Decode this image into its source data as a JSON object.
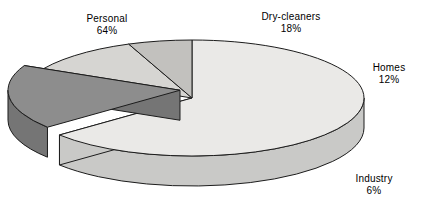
{
  "chart_data": {
    "type": "pie",
    "title": "",
    "subtitle": "",
    "xlabel": "",
    "ylabel": "",
    "legend_position": "none",
    "grid": false,
    "units": "percent",
    "style": "3d-exploded-pie",
    "total": 100,
    "categories": [
      "Personal",
      "Dry-cleaners",
      "Homes",
      "Industry"
    ],
    "values": [
      64,
      18,
      12,
      6
    ],
    "slices": [
      {
        "label": "Personal",
        "value": 64,
        "value_text": "64%",
        "top_color": "#eae9e7",
        "side_color": "#c9c9c7",
        "exploded": false
      },
      {
        "label": "Dry-cleaners",
        "value": 18,
        "value_text": "18%",
        "top_color": "#8d8d8d",
        "side_color": "#757575",
        "exploded": true
      },
      {
        "label": "Homes",
        "value": 12,
        "value_text": "12%",
        "top_color": "#d6d5d2",
        "side_color": "#bcbcba",
        "exploded": false
      },
      {
        "label": "Industry",
        "value": 6,
        "value_text": "6%",
        "top_color": "#c2c1be",
        "side_color": "#b0b0ad",
        "exploded": false
      }
    ],
    "annotations": [
      {
        "name": "Personal",
        "value_text": "64%"
      },
      {
        "name": "Dry-cleaners",
        "value_text": "18%"
      },
      {
        "name": "Homes",
        "value_text": "12%"
      },
      {
        "name": "Industry",
        "value_text": "6%"
      }
    ],
    "colors": {
      "background": "#ffffff",
      "outline": "#1c1c1c",
      "text": "#000000"
    }
  },
  "labels": {
    "personal": {
      "name": "Personal",
      "value": "64%"
    },
    "drycleaners": {
      "name": "Dry-cleaners",
      "value": "18%"
    },
    "homes": {
      "name": "Homes",
      "value": "12%"
    },
    "industry": {
      "name": "Industry",
      "value": "6%"
    }
  }
}
